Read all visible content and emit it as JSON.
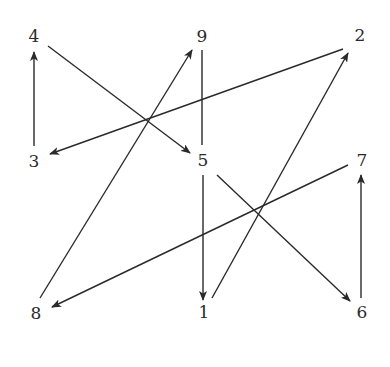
{
  "diagram": {
    "type": "directed-graph",
    "background": "#ffffff",
    "stroke_color": "#2a2a2a",
    "nodes": [
      {
        "id": "4",
        "label": "4",
        "x": 34,
        "y": 36
      },
      {
        "id": "9",
        "label": "9",
        "x": 202,
        "y": 36
      },
      {
        "id": "2",
        "label": "2",
        "x": 360,
        "y": 35
      },
      {
        "id": "3",
        "label": "3",
        "x": 34,
        "y": 161
      },
      {
        "id": "5",
        "label": "5",
        "x": 203,
        "y": 160
      },
      {
        "id": "7",
        "label": "7",
        "x": 362,
        "y": 160
      },
      {
        "id": "8",
        "label": "8",
        "x": 36,
        "y": 313
      },
      {
        "id": "1",
        "label": "1",
        "x": 204,
        "y": 312
      },
      {
        "id": "6",
        "label": "6",
        "x": 362,
        "y": 312
      }
    ],
    "edges": [
      {
        "from": "3",
        "to": "4",
        "directed": true,
        "x1": 34,
        "y1": 146,
        "x2": 34,
        "y2": 52
      },
      {
        "from": "4",
        "to": "5",
        "directed": true,
        "x1": 48,
        "y1": 46,
        "x2": 190,
        "y2": 153
      },
      {
        "from": "2",
        "to": "3",
        "directed": true,
        "x1": 343,
        "y1": 49,
        "x2": 50,
        "y2": 154
      },
      {
        "from": "8",
        "to": "9",
        "directed": true,
        "x1": 40,
        "y1": 298,
        "x2": 192,
        "y2": 50
      },
      {
        "from": "9",
        "to": "5",
        "directed": false,
        "x1": 202,
        "y1": 50,
        "x2": 202,
        "y2": 145
      },
      {
        "from": "5",
        "to": "1",
        "directed": true,
        "x1": 203,
        "y1": 175,
        "x2": 203,
        "y2": 300
      },
      {
        "from": "1",
        "to": "2",
        "directed": true,
        "x1": 212,
        "y1": 298,
        "x2": 348,
        "y2": 53
      },
      {
        "from": "5",
        "to": "6",
        "directed": true,
        "x1": 217,
        "y1": 175,
        "x2": 350,
        "y2": 301
      },
      {
        "from": "7",
        "to": "8",
        "directed": true,
        "x1": 348,
        "y1": 165,
        "x2": 52,
        "y2": 307
      },
      {
        "from": "6",
        "to": "7",
        "directed": true,
        "x1": 361,
        "y1": 298,
        "x2": 361,
        "y2": 175
      }
    ]
  }
}
